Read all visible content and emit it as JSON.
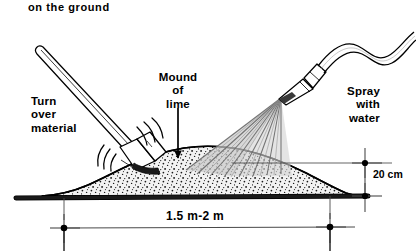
{
  "figure": {
    "caption_top": "on the ground",
    "labels": {
      "turn_over_material": "Turn\nover\nmaterial",
      "mound_of_lime": "Mound\nof\nlime",
      "spray_with_water": "Spray\nwith\nwater"
    },
    "dimensions": {
      "height": "20 cm",
      "width": "1.5 m-2 m"
    },
    "colors": {
      "ink": "#000000",
      "mound_fill": "#efefef",
      "spray_fill": "#c9c9c9",
      "spray_line": "#6e6e6e",
      "dimension_line": "#4a4a4a",
      "background": "#ffffff"
    },
    "elements": {
      "shovel": "shovel-digging-into-mound",
      "hose": "water-hose-s-curve",
      "nozzle": "spray-nozzle",
      "spray_fan": "water-spray-fan",
      "mound": "lime-mound-stippled",
      "ground_line": "ground-baseline",
      "motion_arcs": "shovel-motion-arcs",
      "mound_arrow": "mound-pointer-arrow"
    }
  }
}
